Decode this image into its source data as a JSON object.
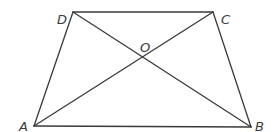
{
  "diagram": {
    "type": "trapezoid-with-diagonals",
    "stroke_color": "#3a3a3a",
    "background": "#ffffff",
    "points": {
      "A": {
        "label": "A",
        "x": 34,
        "y": 126,
        "label_x": 19,
        "label_y": 131
      },
      "B": {
        "label": "B",
        "x": 251,
        "y": 127,
        "label_x": 255,
        "label_y": 131
      },
      "C": {
        "label": "C",
        "x": 213,
        "y": 12,
        "label_x": 221,
        "label_y": 24
      },
      "D": {
        "label": "D",
        "x": 73,
        "y": 12,
        "label_x": 57,
        "label_y": 24
      },
      "O": {
        "label": "O",
        "x": 143,
        "y": 57,
        "label_x": 140,
        "label_y": 52
      }
    },
    "segments": [
      {
        "name": "AB",
        "from": "A",
        "to": "B"
      },
      {
        "name": "BC",
        "from": "B",
        "to": "C"
      },
      {
        "name": "CD",
        "from": "C",
        "to": "D"
      },
      {
        "name": "DA",
        "from": "D",
        "to": "A"
      },
      {
        "name": "AC",
        "from": "A",
        "to": "C"
      },
      {
        "name": "BD",
        "from": "B",
        "to": "D"
      }
    ]
  }
}
